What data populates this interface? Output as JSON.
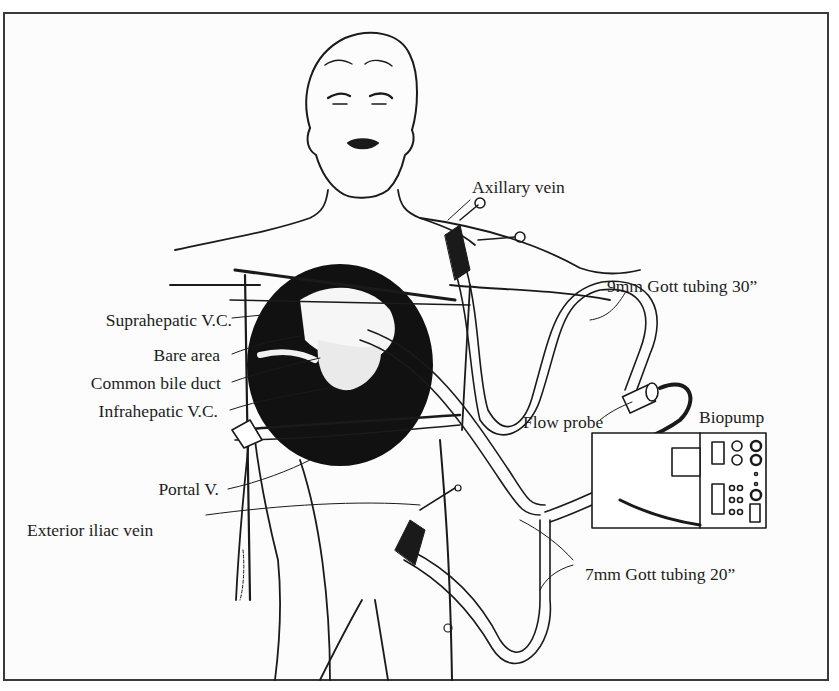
{
  "figure": {
    "labels_left": [
      {
        "id": "suprahepatic-vc",
        "text": "Suprahepatic V.C."
      },
      {
        "id": "bare-area",
        "text": "Bare area"
      },
      {
        "id": "common-bile-duct",
        "text": "Common bile duct"
      },
      {
        "id": "infrahepatic-vc",
        "text": "Infrahepatic V.C."
      },
      {
        "id": "portal-v",
        "text": "Portal V."
      },
      {
        "id": "exterior-iliac-vein",
        "text": "Exterior iliac vein"
      }
    ],
    "labels_right": [
      {
        "id": "axillary-vein",
        "text": "Axillary vein"
      },
      {
        "id": "gott-tubing-9mm",
        "text": "9mm Gott tubing 30”"
      },
      {
        "id": "flow-probe",
        "text": "Flow probe"
      },
      {
        "id": "biopump",
        "text": "Biopump"
      },
      {
        "id": "gott-tubing-7mm",
        "text": "7mm Gott tubing 20”"
      }
    ],
    "colors": {
      "ink": "#1a1a1a",
      "paper": "#fcfcfc",
      "frame": "#3a3a3a"
    }
  }
}
